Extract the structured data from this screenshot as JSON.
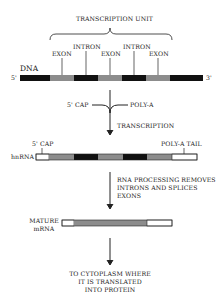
{
  "diagram": {
    "transcription_unit": "TRANSCRIPTION UNIT",
    "dna": {
      "label": "DNA",
      "five_prime": "5'",
      "three_prime": "3'",
      "exon_label": "EXON",
      "intron_label": "INTRON",
      "segments": [
        {
          "type": "flank",
          "x1": 20,
          "x2": 50
        },
        {
          "type": "exon",
          "x1": 50,
          "x2": 74
        },
        {
          "type": "intron",
          "x1": 74,
          "x2": 98
        },
        {
          "type": "exon",
          "x1": 98,
          "x2": 122
        },
        {
          "type": "intron",
          "x1": 122,
          "x2": 146
        },
        {
          "type": "exon",
          "x1": 146,
          "x2": 170
        },
        {
          "type": "flank",
          "x1": 170,
          "x2": 203
        }
      ]
    },
    "transcription_step": {
      "cap_label": "5' CAP",
      "polya_label": "POLY-A",
      "process_label": "TRANSCRIPTION"
    },
    "hnrna": {
      "label": "hnRNA",
      "cap_label": "5' CAP",
      "tail_label": "POLY-A TAIL"
    },
    "processing_step": {
      "line1": "RNA PROCESSING REMOVES",
      "line2": "INTRONS AND SPLICES",
      "line3": "EXONS"
    },
    "mature": {
      "line1": "MATURE",
      "line2": "mRNA"
    },
    "destination": {
      "line1": "TO CYTOPLASM WHERE",
      "line2": "IT IS TRANSLATED",
      "line3": "INTO PROTEIN"
    },
    "colors": {
      "exon": "#8c8c8c",
      "intron": "#111111",
      "untranslated": "#ffffff",
      "line": "#222222"
    }
  }
}
